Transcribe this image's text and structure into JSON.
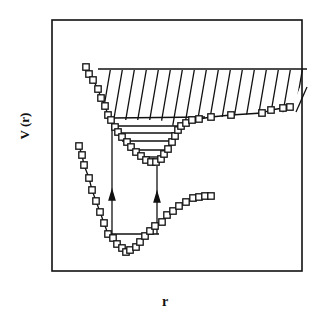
{
  "figure": {
    "y_axis_label": "V (r)",
    "x_axis_label": "r",
    "line_color": "#111111",
    "background": "#ffffff"
  },
  "chart_data": {
    "type": "line",
    "title": "",
    "xlabel": "r",
    "ylabel": "V (r)",
    "grid": false,
    "legend": "none",
    "series": [
      {
        "name": "lower potential curve",
        "marker": "open-square",
        "points_px": [
          [
            79,
            146
          ],
          [
            82,
            155
          ],
          [
            84,
            165
          ],
          [
            89,
            178
          ],
          [
            92,
            190
          ],
          [
            96,
            201
          ],
          [
            100,
            212
          ],
          [
            104,
            223
          ],
          [
            108,
            234
          ],
          [
            113,
            238
          ],
          [
            117,
            244
          ],
          [
            122,
            248
          ],
          [
            126,
            252
          ],
          [
            130,
            250
          ],
          [
            136,
            247
          ],
          [
            140,
            242
          ],
          [
            145,
            236
          ],
          [
            150,
            231
          ],
          [
            155,
            226
          ],
          [
            162,
            222
          ],
          [
            167,
            215
          ],
          [
            173,
            211
          ],
          [
            179,
            206
          ],
          [
            186,
            202
          ],
          [
            193,
            198
          ],
          [
            199,
            197
          ],
          [
            205,
            196
          ],
          [
            211,
            196
          ]
        ]
      },
      {
        "name": "upper potential curve",
        "marker": "open-square",
        "points_px": [
          [
            86,
            67
          ],
          [
            89,
            74
          ],
          [
            93,
            80
          ],
          [
            98,
            89
          ],
          [
            101,
            98
          ],
          [
            105,
            106
          ],
          [
            108,
            115
          ],
          [
            111,
            120
          ],
          [
            115,
            127
          ],
          [
            118,
            132
          ],
          [
            122,
            137
          ],
          [
            127,
            142
          ],
          [
            131,
            147
          ],
          [
            136,
            152
          ],
          [
            141,
            156
          ],
          [
            146,
            160
          ],
          [
            151,
            162
          ],
          [
            156,
            162
          ],
          [
            161,
            159
          ],
          [
            164,
            154
          ],
          [
            168,
            149
          ],
          [
            172,
            142
          ],
          [
            175,
            136
          ],
          [
            178,
            130
          ],
          [
            181,
            126
          ],
          [
            186,
            123
          ],
          [
            192,
            120
          ],
          [
            199,
            119
          ],
          [
            211,
            117
          ],
          [
            231,
            115
          ],
          [
            262,
            113
          ],
          [
            271,
            110
          ],
          [
            283,
            108
          ],
          [
            290,
            107
          ]
        ]
      }
    ],
    "annotations": {
      "hatched_continuum": {
        "top_y": 69,
        "bottom_y": 118,
        "x_from": 100,
        "x_to": 307
      },
      "vibrational_levels_upper_well": [
        126,
        133,
        141,
        150,
        160
      ],
      "lower_well_level_y": 234,
      "transitions": [
        {
          "x": 112,
          "from_y": 234,
          "to_y": 160,
          "arrow": "up"
        },
        {
          "x": 157,
          "from_y": 234,
          "to_y": 170,
          "arrow": "up"
        }
      ]
    }
  }
}
